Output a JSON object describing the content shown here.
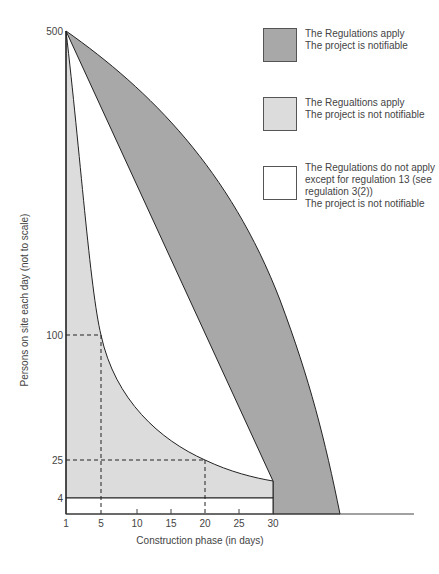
{
  "diagram": {
    "y_axis_label": "Persons on site each day (not to scale)",
    "x_axis_label": "Construction phase (in days)",
    "y_ticks": [
      {
        "label": "500",
        "y": 31
      },
      {
        "label": "100",
        "y": 335
      },
      {
        "label": "25",
        "y": 460
      },
      {
        "label": "4",
        "y": 498
      }
    ],
    "x_ticks": [
      {
        "label": "1",
        "x": 66
      },
      {
        "label": "5",
        "x": 101
      },
      {
        "label": "10",
        "x": 137
      },
      {
        "label": "15",
        "x": 171
      },
      {
        "label": "20",
        "x": 205
      },
      {
        "label": "25",
        "x": 239
      },
      {
        "label": "30",
        "x": 273
      }
    ],
    "colors": {
      "notifiable": "#a8a8a8",
      "not_notifiable": "#dcdcdc",
      "not_apply": "#ffffff",
      "line": "#222222"
    }
  },
  "legend": [
    {
      "id": "notifiable",
      "lines": [
        "The Regulations apply",
        "The project is notifiable"
      ]
    },
    {
      "id": "not_notifiable",
      "lines": [
        "The Regualtions apply",
        "The project is not notifiable"
      ]
    },
    {
      "id": "not_apply",
      "lines": [
        "The Regulations do not apply",
        "except for regulation 13 (see",
        "regulation 3(2))",
        "The project is not notifiable"
      ]
    }
  ]
}
